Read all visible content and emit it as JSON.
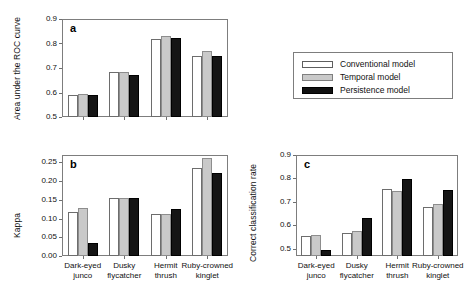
{
  "figure": {
    "legend": {
      "entries": [
        {
          "label": "Conventional model",
          "key": "conventional",
          "color": "#ffffff"
        },
        {
          "label": "Temporal model",
          "key": "temporal",
          "color": "#c9c9c9"
        },
        {
          "label": "Persistence model",
          "key": "persistence",
          "color": "#151515"
        }
      ]
    },
    "categories": [
      "Dark-eyed junco",
      "Dusky flycatcher",
      "Hermit thrush",
      "Ruby-crowned kinglet"
    ],
    "category_lines": [
      [
        "Dark-eyed",
        "junco"
      ],
      [
        "Dusky",
        "flycatcher"
      ],
      [
        "Hermit",
        "thrush"
      ],
      [
        "Ruby-crowned",
        "kinglet"
      ]
    ]
  },
  "chart_data": [
    {
      "type": "bar",
      "panel": "a",
      "title": "",
      "xlabel": "",
      "ylabel": "Area under the ROC curve",
      "categories": [
        "Dark-eyed junco",
        "Dusky flycatcher",
        "Hermit thrush",
        "Ruby-crowned kinglet"
      ],
      "series": [
        {
          "name": "Conventional model",
          "values": [
            0.59,
            0.683,
            0.819,
            0.751
          ]
        },
        {
          "name": "Temporal model",
          "values": [
            0.593,
            0.682,
            0.831,
            0.771
          ]
        },
        {
          "name": "Persistence model",
          "values": [
            0.59,
            0.673,
            0.824,
            0.751
          ]
        }
      ],
      "ylim": [
        0.5,
        0.9
      ],
      "yticks": [
        0.5,
        0.6,
        0.7,
        0.8,
        0.9
      ],
      "ytick_labels": [
        "0.5",
        "0.6",
        "0.7",
        "0.8",
        "0.9"
      ],
      "grid": false,
      "legend_position": "right"
    },
    {
      "type": "bar",
      "panel": "b",
      "title": "",
      "xlabel": "",
      "ylabel": "Kappa",
      "categories": [
        "Dark-eyed junco",
        "Dusky flycatcher",
        "Hermit thrush",
        "Ruby-crowned kinglet"
      ],
      "series": [
        {
          "name": "Conventional model",
          "values": [
            0.118,
            0.154,
            0.113,
            0.235
          ]
        },
        {
          "name": "Temporal model",
          "values": [
            0.128,
            0.156,
            0.113,
            0.262
          ]
        },
        {
          "name": "Persistence model",
          "values": [
            0.035,
            0.154,
            0.125,
            0.222
          ]
        }
      ],
      "ylim": [
        0.0,
        0.27
      ],
      "yticks": [
        0.0,
        0.05,
        0.1,
        0.15,
        0.2,
        0.25
      ],
      "ytick_labels": [
        "0.00",
        "0.05",
        "0.10",
        "0.15",
        "0.20",
        "0.25"
      ],
      "grid": false,
      "legend_position": "none"
    },
    {
      "type": "bar",
      "panel": "c",
      "title": "",
      "xlabel": "",
      "ylabel": "Correct classification rate",
      "categories": [
        "Dark-eyed junco",
        "Dusky flycatcher",
        "Hermit thrush",
        "Ruby-crowned kinglet"
      ],
      "series": [
        {
          "name": "Conventional model",
          "values": [
            0.555,
            0.568,
            0.757,
            0.678
          ]
        },
        {
          "name": "Temporal model",
          "values": [
            0.56,
            0.575,
            0.748,
            0.693
          ]
        },
        {
          "name": "Persistence model",
          "values": [
            0.497,
            0.63,
            0.797,
            0.75
          ]
        }
      ],
      "ylim": [
        0.47,
        0.9
      ],
      "yticks": [
        0.5,
        0.6,
        0.7,
        0.8,
        0.9
      ],
      "ytick_labels": [
        "0.5",
        "0.6",
        "0.7",
        "0.8",
        "0.9"
      ],
      "grid": false,
      "legend_position": "none"
    }
  ],
  "panel_letters": {
    "a": "a",
    "b": "b",
    "c": "c"
  }
}
